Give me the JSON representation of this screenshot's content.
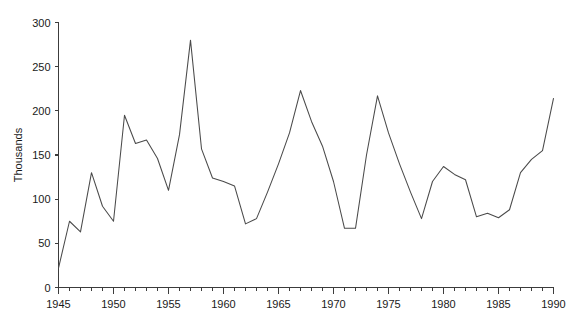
{
  "chart_data": {
    "type": "line",
    "title": "",
    "subtitle": "",
    "xlabel": "",
    "ylabel": "Thousands",
    "xlim": [
      1945,
      1990
    ],
    "ylim": [
      0,
      300
    ],
    "grid": false,
    "legend": "none",
    "x_tick_labels": [
      "1945",
      "1950",
      "1955",
      "1960",
      "1965",
      "1970",
      "1975",
      "1980",
      "1985",
      "1990"
    ],
    "x_tick_values": [
      1945,
      1950,
      1955,
      1960,
      1965,
      1970,
      1975,
      1980,
      1985,
      1990
    ],
    "x_minor_tick_step": 1,
    "y_tick_labels": [
      "0",
      "50",
      "100",
      "150",
      "200",
      "250",
      "300"
    ],
    "y_tick_values": [
      0,
      50,
      100,
      150,
      200,
      250,
      300
    ],
    "x": [
      1945,
      1946,
      1947,
      1948,
      1949,
      1950,
      1951,
      1952,
      1953,
      1954,
      1955,
      1956,
      1957,
      1958,
      1959,
      1960,
      1961,
      1962,
      1963,
      1964,
      1965,
      1966,
      1967,
      1968,
      1969,
      1970,
      1971,
      1972,
      1973,
      1974,
      1975,
      1976,
      1977,
      1978,
      1979,
      1980,
      1981,
      1982,
      1983,
      1984,
      1985,
      1986,
      1987,
      1988,
      1989,
      1990
    ],
    "values": [
      22,
      75,
      63,
      130,
      92,
      75,
      195,
      163,
      167,
      146,
      110,
      173,
      280,
      157,
      124,
      120,
      115,
      72,
      78,
      108,
      140,
      175,
      223,
      188,
      160,
      120,
      67,
      67,
      150,
      217,
      175,
      140,
      108,
      78,
      120,
      137,
      128,
      122,
      80,
      84,
      79,
      88,
      130,
      145,
      155,
      214
    ],
    "series": [
      {
        "name": "series-1",
        "color": "#4a4a4a",
        "values": [
          22,
          75,
          63,
          130,
          92,
          75,
          195,
          163,
          167,
          146,
          110,
          173,
          280,
          157,
          124,
          120,
          115,
          72,
          78,
          108,
          140,
          175,
          223,
          188,
          160,
          120,
          67,
          67,
          150,
          217,
          175,
          140,
          108,
          78,
          120,
          137,
          128,
          122,
          80,
          84,
          79,
          88,
          130,
          145,
          155,
          214
        ]
      }
    ],
    "annotations": []
  },
  "colors": {
    "line": "#4a4a4a",
    "axis": "#3c3c3c",
    "text": "#1a1a1a",
    "background": "#ffffff"
  }
}
